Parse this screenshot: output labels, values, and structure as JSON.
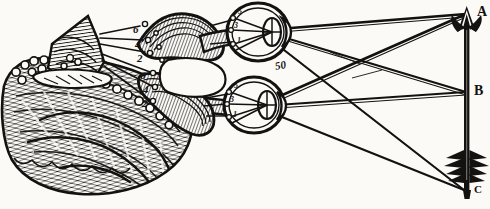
{
  "figure": {
    "medium": "woodcut engraving",
    "ink_color": "#141210",
    "paper_color": "#fbfaf7",
    "width": 490,
    "height": 209
  },
  "object": {
    "name": "arrow",
    "description": "vertical arrow seen by both eyes",
    "points": [
      {
        "id": "A",
        "label": "A",
        "role": "arrow-tip",
        "x": 470,
        "y": 12
      },
      {
        "id": "B",
        "label": "B",
        "role": "arrow-middle",
        "x": 470,
        "y": 92
      },
      {
        "id": "C",
        "label": "C",
        "role": "arrow-fletching",
        "x": 468,
        "y": 192
      }
    ]
  },
  "eyes": {
    "upper": {
      "name": "right-eye",
      "retina_labels": [
        "5",
        "3",
        "1"
      ],
      "center": {
        "x": 262,
        "y": 32
      }
    },
    "lower": {
      "name": "left-eye",
      "retina_labels": [
        "5",
        "3",
        "1"
      ],
      "center": {
        "x": 258,
        "y": 105
      }
    }
  },
  "nerve_labels": {
    "upper_tract": [
      "6",
      "4",
      "2"
    ],
    "lower_tract": [
      "6",
      "4",
      "2"
    ]
  },
  "annotations": {
    "center_mark": "50"
  },
  "anatomy": {
    "pineal_gland": "pineal-gland",
    "cerebellum": "cerebellum-hatched-mass",
    "optic_nerves": "optic-nerve-tracts",
    "ventricle": "brain-ventricle-cavity"
  }
}
